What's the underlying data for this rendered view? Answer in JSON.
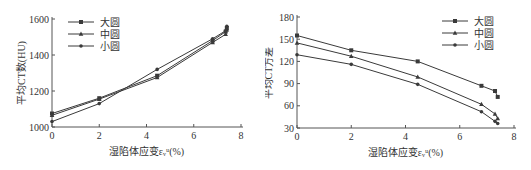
{
  "chart_data": [
    {
      "type": "line",
      "title": "",
      "xlabel": "湿陷体应变εᵥᵘ(%)",
      "ylabel": "平均CT数(HU)",
      "xlim": [
        0,
        8
      ],
      "ylim": [
        1000,
        1600
      ],
      "xticks": [
        0,
        2,
        4,
        6,
        8
      ],
      "yticks": [
        1000,
        1200,
        1400,
        1600
      ],
      "grid": false,
      "legend_position": "upper-left",
      "series": [
        {
          "name": "大圆",
          "marker": "square",
          "x": [
            0,
            2,
            4.45,
            6.8,
            7.35,
            7.4
          ],
          "values": [
            1075,
            1160,
            1285,
            1480,
            1530,
            1550
          ]
        },
        {
          "name": "中圆",
          "marker": "triangle",
          "x": [
            0,
            2,
            4.45,
            6.8,
            7.35,
            7.4
          ],
          "values": [
            1065,
            1155,
            1275,
            1470,
            1515,
            1540
          ]
        },
        {
          "name": "小圆",
          "marker": "star",
          "x": [
            0,
            2,
            4.45,
            6.8,
            7.35,
            7.4
          ],
          "values": [
            1030,
            1130,
            1320,
            1490,
            1535,
            1560
          ]
        }
      ]
    },
    {
      "type": "line",
      "title": "",
      "xlabel": "湿陷体应变εᵥᵘ(%)",
      "ylabel": "平均CT方差",
      "xlim": [
        0,
        8
      ],
      "ylim": [
        30,
        180
      ],
      "xticks": [
        0,
        2,
        4,
        6,
        8
      ],
      "yticks": [
        30,
        60,
        90,
        120,
        150,
        180
      ],
      "grid": false,
      "legend_position": "upper-right",
      "series": [
        {
          "name": "大圆",
          "marker": "square",
          "x": [
            0,
            2,
            4.45,
            6.8,
            7.3,
            7.4
          ],
          "values": [
            155,
            135,
            120,
            87,
            80,
            72
          ]
        },
        {
          "name": "中圆",
          "marker": "triangle",
          "x": [
            0,
            2,
            4.45,
            6.8,
            7.3,
            7.4
          ],
          "values": [
            145,
            127,
            99,
            62,
            49,
            43
          ]
        },
        {
          "name": "小圆",
          "marker": "star",
          "x": [
            0,
            2,
            4.45,
            6.8,
            7.3,
            7.4
          ],
          "values": [
            129,
            116,
            89,
            52,
            39,
            36
          ]
        }
      ]
    }
  ],
  "layout": {
    "left": {
      "x0": 52,
      "x1": 241,
      "y0": 127,
      "y1": 19
    },
    "right": {
      "x0": 32,
      "x1": 249,
      "y0": 128,
      "y1": 17
    }
  },
  "colors": {
    "line": "#3a3a3a",
    "axis": "#555555",
    "text": "#333333"
  }
}
